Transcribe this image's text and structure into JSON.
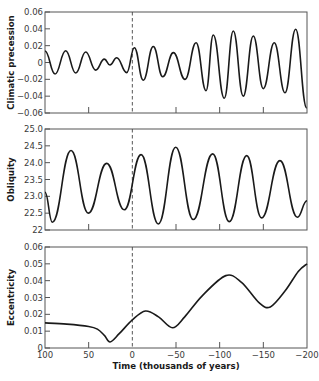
{
  "chart_data": [
    {
      "type": "line",
      "panel": "precession",
      "ylabel": "Climatic precession",
      "ylim": [
        -0.06,
        0.06
      ],
      "yticks": [
        0.06,
        0.04,
        0.02,
        0,
        -0.02,
        -0.04,
        -0.06
      ],
      "ytick_labels": [
        "0.06",
        "0.04",
        "0.02",
        "0",
        "−0.02",
        "−0.04",
        "−0.06"
      ],
      "xlim": [
        100,
        -200
      ],
      "grid": false,
      "x": [
        100,
        88.5,
        76.3,
        64.8,
        53.4,
        42,
        32,
        25.6,
        17.9,
        6.4,
        -2.3,
        -12.5,
        -24,
        -34.8,
        -47,
        -60.3,
        -73,
        -84.4,
        -92.7,
        -105.3,
        -115.6,
        -127,
        -138.5,
        -150,
        -162.5,
        -174.8,
        -187,
        -199.7
      ],
      "y": [
        0.0137,
        -0.0137,
        0.014,
        -0.0125,
        0.0125,
        -0.009,
        0.004,
        -0.003,
        0.0057,
        -0.012,
        0.0176,
        -0.021,
        0.019,
        -0.017,
        0.0117,
        -0.02,
        0.0235,
        -0.0335,
        0.0327,
        -0.0425,
        0.0374,
        -0.04,
        0.0315,
        -0.031,
        0.0235,
        -0.036,
        0.0395,
        -0.054
      ]
    },
    {
      "type": "line",
      "panel": "obliquity",
      "ylabel": "Obliquity",
      "ylim": [
        22,
        25
      ],
      "yticks": [
        25.0,
        24.5,
        24.0,
        23.5,
        23.0,
        22.5,
        22
      ],
      "ytick_labels": [
        "25.0",
        "24.5",
        "24.0",
        "23.5",
        "23.0",
        "22.5",
        "22"
      ],
      "xlim": [
        100,
        -200
      ],
      "grid": false,
      "x": [
        100,
        91.6,
        70.2,
        50.4,
        29.4,
        9.2,
        -10,
        -29.8,
        -49.7,
        -69.8,
        -92,
        -111,
        -131,
        -148,
        -169,
        -189,
        -200
      ],
      "y": [
        23.12,
        22.23,
        24.36,
        22.5,
        23.98,
        22.6,
        24.24,
        22.18,
        24.46,
        22.31,
        24.26,
        22.25,
        24.21,
        22.36,
        24.06,
        22.38,
        22.87
      ]
    },
    {
      "type": "line",
      "panel": "eccentricity",
      "ylabel": "Eccentricity",
      "xlabel": "Time (thousands of years)",
      "ylim": [
        0,
        0.06
      ],
      "yticks": [
        0.06,
        0.05,
        0.04,
        0.03,
        0.02,
        0.01,
        0
      ],
      "ytick_labels": [
        "0.06",
        "0.05",
        "0.04",
        "0.03",
        "0.02",
        "0.01",
        "0"
      ],
      "xlim": [
        100,
        -200
      ],
      "xticks": [
        100,
        50,
        0,
        -50,
        -100,
        -150,
        -200
      ],
      "xtick_labels": [
        "100",
        "50",
        "0",
        "−50",
        "−100",
        "−150",
        "−200"
      ],
      "grid": false,
      "x": [
        100,
        75,
        50,
        40,
        32,
        25.5,
        15,
        0,
        -15,
        -30,
        -46,
        -60,
        -80,
        -107,
        -125,
        -145,
        -158,
        -175,
        -190,
        -200
      ],
      "y": [
        0.0149,
        0.0142,
        0.0128,
        0.0112,
        0.0075,
        0.0036,
        0.0085,
        0.0167,
        0.022,
        0.0185,
        0.012,
        0.0185,
        0.031,
        0.043,
        0.039,
        0.027,
        0.0244,
        0.034,
        0.0455,
        0.05
      ]
    }
  ],
  "annotations": {
    "present_marker": {
      "x": 0,
      "style": "dashed vertical line"
    }
  },
  "colors": {
    "line": "#1a1a1a",
    "frame": "#555555",
    "dashed": "#444444",
    "text": "#3a3a3a"
  }
}
